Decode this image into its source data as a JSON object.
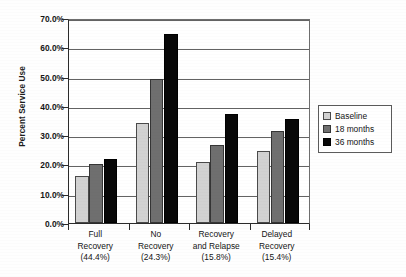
{
  "chart_data": {
    "type": "bar",
    "title": "",
    "subtitle": "",
    "xlabel": "",
    "ylabel": "Percent Service Use",
    "ylim": [
      0,
      70
    ],
    "ytick_labels": [
      "70.0%",
      "60.0%",
      "50.0%",
      "40.0%",
      "30.0%",
      "20.0%",
      "10.0%",
      "0.0%"
    ],
    "ytick_values": [
      70,
      60,
      50,
      40,
      30,
      20,
      10,
      0
    ],
    "grid": "horizontal",
    "legend_position": "right",
    "categories": [
      "Full Recovery",
      "No Recovery",
      "Recovery and Relapse",
      "Delayed Recovery"
    ],
    "category_labels": [
      {
        "lines": [
          "Full",
          "Recovery"
        ],
        "percent": "(44.4%)"
      },
      {
        "lines": [
          "No",
          "Recovery"
        ],
        "percent": "(24.3%)"
      },
      {
        "lines": [
          "Recovery",
          "and Relapse"
        ],
        "percent": "(15.8%)"
      },
      {
        "lines": [
          "Delayed",
          "Recovery"
        ],
        "percent": "(15.4%)"
      }
    ],
    "series": [
      {
        "name": "Baseline",
        "color": "#d2d2d2",
        "values": [
          16.2,
          34.0,
          20.9,
          24.5
        ]
      },
      {
        "name": "18 months",
        "color": "#6f6f6f",
        "values": [
          20.1,
          49.3,
          26.8,
          31.5
        ]
      },
      {
        "name": "36 months",
        "color": "#080808",
        "values": [
          21.9,
          64.6,
          37.1,
          35.4
        ]
      }
    ]
  },
  "legend": {
    "items": [
      {
        "label": "Baseline",
        "swatch": "series-baseline"
      },
      {
        "label": "18 months",
        "swatch": "series-18"
      },
      {
        "label": "36 months",
        "swatch": "series-36"
      }
    ]
  },
  "axis": {
    "y_title": "Percent Service Use"
  }
}
